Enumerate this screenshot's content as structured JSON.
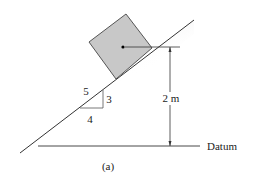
{
  "figure": {
    "caption": "(a)",
    "slope": {
      "hyp": "5",
      "rise": "3",
      "run": "4"
    },
    "height_label": "2 m",
    "datum_label": "Datum",
    "colors": {
      "block_fill": "#c8c8c8",
      "block_stroke": "#555555",
      "incline_shade": "#bdbdbd",
      "line": "#333333"
    }
  }
}
